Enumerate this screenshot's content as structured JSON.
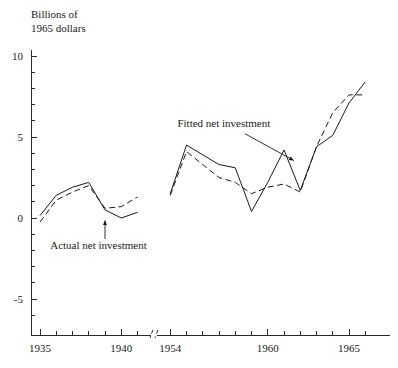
{
  "chart_data": {
    "type": "line",
    "title": "",
    "subtitle": "",
    "xlabel": "",
    "ylabel": "Billions of 1965 dollars",
    "ylabel_lines": [
      "Billions of",
      "1965 dollars"
    ],
    "ylim": [
      -7,
      11
    ],
    "y_ticks_major": [
      10,
      5,
      0,
      -5
    ],
    "y_tick_labels": [
      "10",
      "5",
      "0",
      "-5"
    ],
    "y_ticks_minor": [
      9,
      8,
      7,
      6,
      4,
      3,
      2,
      1,
      -1,
      -2,
      -3,
      -4,
      -6
    ],
    "x_ticks_major": [
      1935,
      1940,
      1954,
      1960,
      1965
    ],
    "x_tick_labels": [
      "1935",
      "1940",
      "1954",
      "1960",
      "1965"
    ],
    "x_ticks_minor": [
      1936,
      1937,
      1938,
      1939,
      1941,
      1955,
      1956,
      1957,
      1958,
      1959,
      1961,
      1962,
      1963,
      1964,
      1966
    ],
    "axis_break": {
      "present": true,
      "between": [
        1941,
        1954
      ],
      "symbol": "//"
    },
    "grid": false,
    "legend": "inline-annotations",
    "series": [
      {
        "name": "Actual net investment",
        "style": "solid",
        "color": "#1a1a1a",
        "segments": [
          {
            "x": [
              1935,
              1936,
              1937,
              1938,
              1939,
              1940,
              1941
            ],
            "values": [
              0.15,
              1.4,
              1.9,
              2.2,
              0.5,
              0.0,
              0.35
            ]
          },
          {
            "x": [
              1954,
              1955,
              1956,
              1957,
              1958,
              1959,
              1960,
              1961,
              1962,
              1963,
              1964,
              1965,
              1966
            ],
            "values": [
              1.5,
              4.5,
              3.9,
              3.3,
              3.1,
              0.4,
              2.2,
              4.2,
              1.7,
              4.4,
              5.1,
              7.1,
              8.4
            ]
          }
        ]
      },
      {
        "name": "Fitted net investment",
        "style": "dashed",
        "color": "#1a1a1a",
        "segments": [
          {
            "x": [
              1935,
              1936,
              1937,
              1938,
              1939,
              1940,
              1941
            ],
            "values": [
              -0.25,
              1.1,
              1.6,
              2.0,
              0.6,
              0.7,
              1.3
            ]
          },
          {
            "x": [
              1954,
              1955,
              1956,
              1957,
              1958,
              1959,
              1960,
              1961,
              1962,
              1963,
              1964,
              1965,
              1966
            ],
            "values": [
              1.4,
              4.1,
              3.3,
              2.5,
              2.2,
              1.5,
              1.9,
              2.1,
              1.6,
              4.4,
              6.5,
              7.6,
              7.6
            ]
          }
        ]
      }
    ],
    "annotations": [
      {
        "text": "Actual net investment",
        "label_x": 1938.6,
        "label_y": -1.9,
        "anchor": "middle",
        "leader_from": [
          1939.0,
          -1.3
        ],
        "leader_to": [
          1939.0,
          -0.15
        ],
        "arrow": "up"
      },
      {
        "text": "Fitted net investment",
        "label_x": 1957.3,
        "label_y": 5.6,
        "anchor": "middle",
        "leader_from": [
          1958.6,
          5.2
        ],
        "leader_to": [
          1961.6,
          3.55
        ],
        "arrow": "end"
      }
    ]
  }
}
